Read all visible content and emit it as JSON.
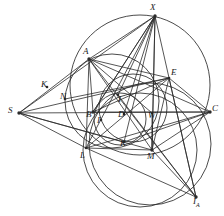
{
  "figure": {
    "background_color": "#ffffff",
    "stroke_color": "#2b2b2b",
    "label_color": "#1a1a1a",
    "width": 224,
    "height": 216
  },
  "points": [
    {
      "id": "X",
      "label": "X",
      "x": 155,
      "y": 16,
      "lx": 150,
      "ly": 3,
      "role": "arc-midpoint-top"
    },
    {
      "id": "A",
      "label": "A",
      "x": 89,
      "y": 59,
      "lx": 83,
      "ly": 47,
      "role": "triangle-vertex"
    },
    {
      "id": "E",
      "label": "E",
      "x": 169,
      "y": 78,
      "lx": 171,
      "ly": 68,
      "role": "circle-intersection"
    },
    {
      "id": "S",
      "label": "S",
      "x": 19,
      "y": 113,
      "lx": 8,
      "ly": 106,
      "role": "external-pole"
    },
    {
      "id": "C",
      "label": "C",
      "x": 210,
      "y": 112,
      "lx": 212,
      "ly": 104,
      "role": "triangle-vertex"
    },
    {
      "id": "Kp",
      "label": "K",
      "x": 47,
      "y": 87,
      "lx": 41,
      "ly": 80,
      "role": "tangency-label"
    },
    {
      "id": "N",
      "label": "N",
      "x": 65,
      "y": 99,
      "lx": 60,
      "ly": 92,
      "role": "nine-point-center"
    },
    {
      "id": "I",
      "label": "I",
      "x": 118,
      "y": 95,
      "lx": 118,
      "ly": 95,
      "role": "incenter"
    },
    {
      "id": "B",
      "label": "B",
      "x": 93,
      "y": 112,
      "lx": 86,
      "ly": 110,
      "role": "triangle-vertex"
    },
    {
      "id": "I1",
      "label": "I",
      "x": 101,
      "y": 120,
      "lx": 97,
      "ly": 116,
      "role": "touch-point"
    },
    {
      "id": "D",
      "label": "D",
      "x": 124,
      "y": 114,
      "lx": 118,
      "ly": 110,
      "role": "foot-point"
    },
    {
      "id": "W",
      "label": "W",
      "x": 152,
      "y": 113,
      "lx": 148,
      "ly": 111,
      "role": "midpoint"
    },
    {
      "id": "L",
      "label": "L",
      "x": 86,
      "y": 148,
      "lx": 80,
      "ly": 151,
      "role": "circle-intersection"
    },
    {
      "id": "K",
      "label": "K",
      "x": 124,
      "y": 142,
      "lx": 120,
      "ly": 139,
      "role": "tangency-point"
    },
    {
      "id": "M",
      "label": "M",
      "x": 152,
      "y": 150,
      "lx": 147,
      "ly": 152,
      "role": "arc-midpoint-bottom"
    },
    {
      "id": "IA",
      "label": "I",
      "sublabel": "A",
      "x": 196,
      "y": 197,
      "lx": 193,
      "ly": 197,
      "role": "excenter"
    }
  ],
  "circles": [
    {
      "name": "circumcircle-ABC",
      "cx": 140,
      "cy": 85,
      "r": 70
    },
    {
      "name": "incircle",
      "cx": 120,
      "cy": 119,
      "r": 26
    },
    {
      "name": "mixtilinear-circle",
      "cx": 112,
      "cy": 101,
      "r": 47
    },
    {
      "name": "excircle-A",
      "cx": 150,
      "cy": 144,
      "r": 61
    },
    {
      "name": "circle-through-L-IA",
      "cx": 140,
      "cy": 150,
      "r": 57
    },
    {
      "name": "small-inner-circle",
      "cx": 133,
      "cy": 108,
      "r": 34
    }
  ],
  "segments": [
    {
      "name": "S-to-C-axis",
      "from": "S",
      "to": "C"
    },
    {
      "name": "S-to-A",
      "from": "S",
      "to": "A"
    },
    {
      "name": "S-to-E",
      "from": "S",
      "to": "E"
    },
    {
      "name": "S-to-L",
      "from": "S",
      "to": "L"
    },
    {
      "name": "S-to-M",
      "from": "S",
      "to": "M"
    },
    {
      "name": "S-to-K",
      "from": "S",
      "to": "K"
    },
    {
      "name": "S-to-X",
      "from": "S",
      "to": "X"
    },
    {
      "name": "A-to-C",
      "from": "A",
      "to": "C"
    },
    {
      "name": "A-to-B",
      "from": "A",
      "to": "B"
    },
    {
      "name": "A-to-M",
      "from": "A",
      "to": "M"
    },
    {
      "name": "A-to-IA",
      "from": "A",
      "to": "IA"
    },
    {
      "name": "A-to-E",
      "from": "A",
      "to": "E"
    },
    {
      "name": "A-to-X",
      "from": "A",
      "to": "X"
    },
    {
      "name": "A-to-L",
      "from": "A",
      "to": "L"
    },
    {
      "name": "A-to-W",
      "from": "A",
      "to": "W"
    },
    {
      "name": "X-to-B",
      "from": "X",
      "to": "B"
    },
    {
      "name": "X-to-L",
      "from": "X",
      "to": "L"
    },
    {
      "name": "X-to-M",
      "from": "X",
      "to": "M"
    },
    {
      "name": "X-to-K",
      "from": "X",
      "to": "K"
    },
    {
      "name": "X-to-I",
      "from": "X",
      "to": "I"
    },
    {
      "name": "X-to-IA",
      "from": "X",
      "to": "IA"
    },
    {
      "name": "X-to-D",
      "from": "X",
      "to": "D"
    },
    {
      "name": "B-to-C",
      "from": "B",
      "to": "C"
    },
    {
      "name": "B-to-E",
      "from": "B",
      "to": "E"
    },
    {
      "name": "B-to-X",
      "from": "B",
      "to": "X"
    },
    {
      "name": "L-to-C",
      "from": "L",
      "to": "C"
    },
    {
      "name": "L-to-E",
      "from": "L",
      "to": "E"
    },
    {
      "name": "L-to-IA",
      "from": "L",
      "to": "IA"
    },
    {
      "name": "L-to-M",
      "from": "L",
      "to": "M"
    },
    {
      "name": "M-to-E",
      "from": "M",
      "to": "E"
    },
    {
      "name": "M-to-C",
      "from": "M",
      "to": "C"
    },
    {
      "name": "M-to-IA",
      "from": "M",
      "to": "IA"
    },
    {
      "name": "M-to-W",
      "from": "M",
      "to": "W"
    },
    {
      "name": "E-to-IA",
      "from": "E",
      "to": "IA"
    },
    {
      "name": "E-to-C",
      "from": "E",
      "to": "C"
    },
    {
      "name": "I-to-IA",
      "from": "I",
      "to": "IA"
    },
    {
      "name": "K-to-C",
      "from": "K",
      "to": "C"
    },
    {
      "name": "N-to-E",
      "from": "N",
      "to": "E"
    },
    {
      "name": "X-to-W-vertical",
      "from": "X",
      "to": "M"
    }
  ]
}
